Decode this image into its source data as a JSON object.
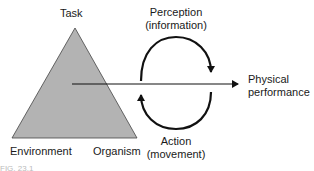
{
  "diagram": {
    "labels": {
      "task": "Task",
      "environment": "Environment",
      "organism": "Organism",
      "perception_line1": "Perception",
      "perception_line2": "(information)",
      "action_line1": "Action",
      "action_line2": "(movement)",
      "physical_line1": "Physical",
      "physical_line2": "performance"
    },
    "colors": {
      "triangle_fill": "#b3b3b3",
      "stroke": "#111111"
    },
    "caption": "FIG. 23.1"
  }
}
